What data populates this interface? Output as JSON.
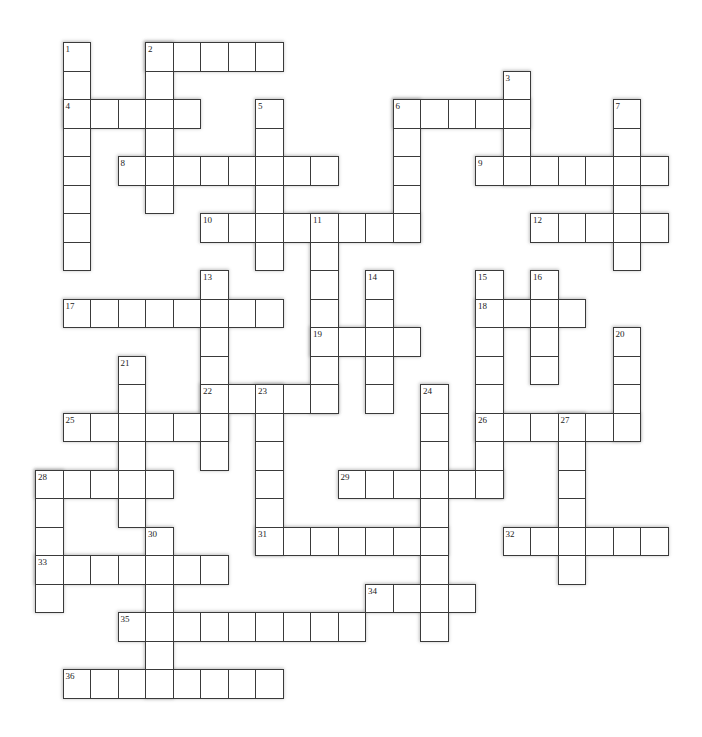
{
  "puzzle": {
    "grid_cols": 23,
    "grid_rows": 23,
    "colors": {
      "background": "#ffffff",
      "cell_fill": "#ffffff",
      "cell_border": "#3a3a3a",
      "number_text": "#222222"
    },
    "across": [
      {
        "number": 2,
        "row": 0,
        "col": 4,
        "length": 5
      },
      {
        "number": 4,
        "row": 2,
        "col": 1,
        "length": 5
      },
      {
        "number": 6,
        "row": 2,
        "col": 13,
        "length": 5
      },
      {
        "number": 8,
        "row": 4,
        "col": 3,
        "length": 8
      },
      {
        "number": 9,
        "row": 4,
        "col": 16,
        "length": 7
      },
      {
        "number": 10,
        "row": 6,
        "col": 6,
        "length": 8
      },
      {
        "number": 12,
        "row": 6,
        "col": 18,
        "length": 5
      },
      {
        "number": 17,
        "row": 9,
        "col": 1,
        "length": 8
      },
      {
        "number": 18,
        "row": 9,
        "col": 16,
        "length": 4
      },
      {
        "number": 19,
        "row": 10,
        "col": 10,
        "length": 4
      },
      {
        "number": 22,
        "row": 12,
        "col": 6,
        "length": 5
      },
      {
        "number": 25,
        "row": 13,
        "col": 1,
        "length": 6
      },
      {
        "number": 26,
        "row": 13,
        "col": 16,
        "length": 6
      },
      {
        "number": 28,
        "row": 15,
        "col": 0,
        "length": 5
      },
      {
        "number": 29,
        "row": 15,
        "col": 11,
        "length": 6
      },
      {
        "number": 31,
        "row": 17,
        "col": 8,
        "length": 7
      },
      {
        "number": 32,
        "row": 17,
        "col": 17,
        "length": 6
      },
      {
        "number": 33,
        "row": 18,
        "col": 0,
        "length": 7
      },
      {
        "number": 34,
        "row": 19,
        "col": 12,
        "length": 4
      },
      {
        "number": 35,
        "row": 20,
        "col": 3,
        "length": 9
      },
      {
        "number": 36,
        "row": 22,
        "col": 1,
        "length": 8
      }
    ],
    "down": [
      {
        "number": 1,
        "row": 0,
        "col": 1,
        "length": 8
      },
      {
        "number": 2,
        "row": 0,
        "col": 4,
        "length": 6
      },
      {
        "number": 3,
        "row": 1,
        "col": 17,
        "length": 4
      },
      {
        "number": 5,
        "row": 2,
        "col": 8,
        "length": 6
      },
      {
        "number": 6,
        "row": 2,
        "col": 13,
        "length": 5
      },
      {
        "number": 7,
        "row": 2,
        "col": 21,
        "length": 6
      },
      {
        "number": 11,
        "row": 6,
        "col": 10,
        "length": 7
      },
      {
        "number": 13,
        "row": 8,
        "col": 6,
        "length": 7
      },
      {
        "number": 14,
        "row": 8,
        "col": 12,
        "length": 5
      },
      {
        "number": 15,
        "row": 8,
        "col": 16,
        "length": 8
      },
      {
        "number": 16,
        "row": 8,
        "col": 18,
        "length": 4
      },
      {
        "number": 20,
        "row": 10,
        "col": 21,
        "length": 4
      },
      {
        "number": 21,
        "row": 11,
        "col": 3,
        "length": 6
      },
      {
        "number": 23,
        "row": 12,
        "col": 8,
        "length": 6
      },
      {
        "number": 24,
        "row": 12,
        "col": 14,
        "length": 9
      },
      {
        "number": 27,
        "row": 13,
        "col": 19,
        "length": 6
      },
      {
        "number": 28,
        "row": 15,
        "col": 0,
        "length": 5
      },
      {
        "number": 30,
        "row": 17,
        "col": 4,
        "length": 6
      }
    ]
  }
}
